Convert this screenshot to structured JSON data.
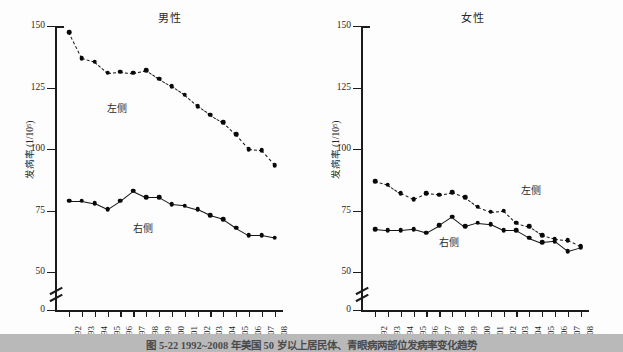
{
  "figure": {
    "caption": "图 5-22  1992~2008 年美国 50 岁以上居民体、青眼病两部位发病率变化趋势",
    "ylabel": "发病率 (1/10⁵)"
  },
  "legend": {
    "left_label": "左侧",
    "right_label": "右侧"
  },
  "chart_data": [
    {
      "type": "line",
      "title": "男性",
      "xlabel": "",
      "ylabel": "发病率 (1/10⁵)",
      "x": [
        "1992",
        "1993",
        "1994",
        "1995",
        "1996",
        "1997",
        "1998",
        "1999",
        "2000",
        "2001",
        "2002",
        "2003",
        "2004",
        "2005",
        "2006",
        "2007",
        "2008"
      ],
      "yticks": [
        0,
        50,
        75,
        100,
        125,
        150
      ],
      "ylim": [
        50,
        150
      ],
      "axis_break": true,
      "grid": false,
      "legend_position": "inline-annotation",
      "series": [
        {
          "name": "左侧",
          "style": "dashed",
          "values": [
            147.5,
            137.0,
            135.5,
            131.0,
            131.5,
            131.0,
            132.0,
            128.5,
            125.5,
            122.0,
            117.5,
            114.0,
            111.0,
            106.0,
            100.0,
            99.5,
            93.5
          ]
        },
        {
          "name": "右侧",
          "style": "solid",
          "values": [
            79.0,
            79.0,
            78.0,
            75.5,
            79.0,
            83.0,
            80.5,
            80.5,
            77.5,
            77.0,
            75.5,
            73.0,
            71.5,
            68.0,
            65.0,
            65.0,
            64.0
          ]
        }
      ]
    },
    {
      "type": "line",
      "title": "女性",
      "xlabel": "",
      "ylabel": "发病率 (1/10⁵)",
      "x": [
        "1992",
        "1993",
        "1994",
        "1995",
        "1996",
        "1997",
        "1998",
        "1999",
        "2000",
        "2001",
        "2002",
        "2003",
        "2004",
        "2005",
        "2006",
        "2007",
        "2008"
      ],
      "yticks": [
        0,
        50,
        75,
        100,
        125,
        150
      ],
      "ylim": [
        50,
        150
      ],
      "axis_break": true,
      "grid": false,
      "legend_position": "inline-annotation",
      "series": [
        {
          "name": "左侧",
          "style": "dashed",
          "values": [
            87.0,
            85.5,
            82.0,
            79.5,
            82.0,
            81.5,
            82.5,
            80.5,
            76.5,
            74.5,
            75.0,
            70.0,
            68.5,
            65.0,
            63.5,
            63.0,
            60.5
          ]
        },
        {
          "name": "右侧",
          "style": "solid",
          "values": [
            67.5,
            67.0,
            67.0,
            67.5,
            66.0,
            69.0,
            72.5,
            68.5,
            70.0,
            69.5,
            67.0,
            67.0,
            64.0,
            62.0,
            62.5,
            58.5,
            60.0
          ]
        }
      ]
    }
  ]
}
